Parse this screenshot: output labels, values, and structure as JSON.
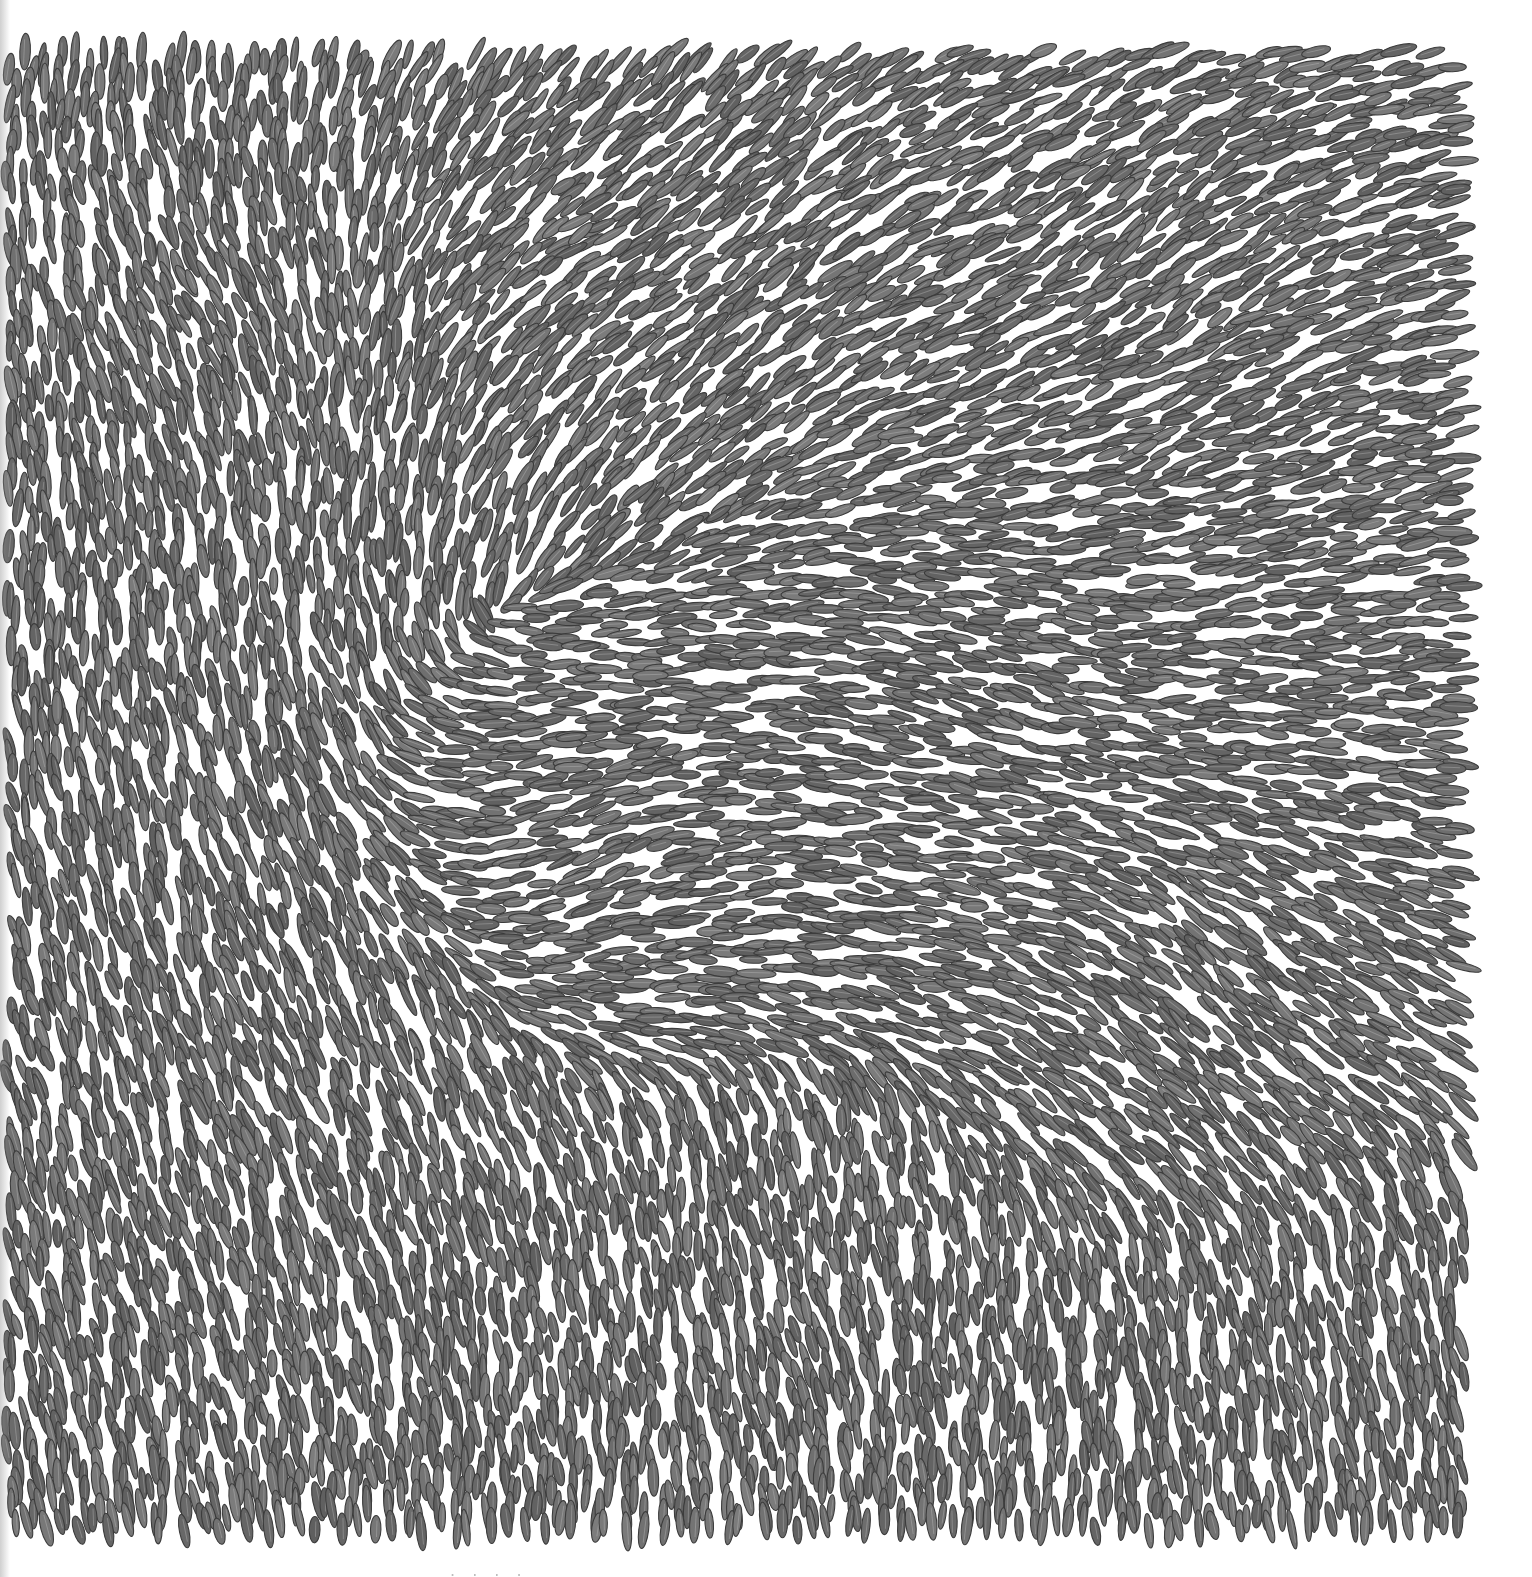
{
  "artwork": {
    "subject": "graphite drawing of densely packed rice grains in swirling flow patterns",
    "medium_appearance": "pencil/graphite on white paper",
    "background_color": "#ffffff",
    "grain_fill_color": "#6e6e6e",
    "grain_outline_color": "#3c3c3c",
    "drawing_bounds": {
      "left": 6,
      "top": 50,
      "right": 1480,
      "bottom": 1532
    },
    "grain_length_px": [
      26,
      40
    ],
    "grain_width_px": [
      7,
      11
    ],
    "flow_regions": [
      {
        "cx": 200,
        "cy": 300,
        "angle_deg": 60,
        "swirl": 0.6
      },
      {
        "cx": 600,
        "cy": 250,
        "angle_deg": -30,
        "swirl": -0.5
      },
      {
        "cx": 1150,
        "cy": 250,
        "angle_deg": -40,
        "swirl": 0.4
      },
      {
        "cx": 1000,
        "cy": 700,
        "angle_deg": 20,
        "swirl": -0.7
      },
      {
        "cx": 600,
        "cy": 850,
        "angle_deg": -20,
        "swirl": 0.8
      },
      {
        "cx": 300,
        "cy": 1100,
        "angle_deg": 70,
        "swirl": 0.3
      },
      {
        "cx": 1200,
        "cy": 1000,
        "angle_deg": 45,
        "swirl": -0.4
      },
      {
        "cx": 800,
        "cy": 1350,
        "angle_deg": 75,
        "swirl": 0.5
      },
      {
        "cx": 1300,
        "cy": 1400,
        "angle_deg": 80,
        "swirl": 0.2
      }
    ]
  },
  "caption": {
    "text": "· ·  ·   ·",
    "note": "partially cropped text at bottom edge, unreadable"
  }
}
